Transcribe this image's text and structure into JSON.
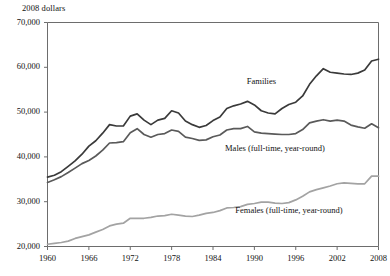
{
  "chart_data": {
    "type": "line",
    "title": "",
    "ylabel": "2008 dollars",
    "xlabel": "",
    "ylim": [
      20000,
      70000
    ],
    "xlim": [
      1960,
      2008
    ],
    "grid": false,
    "legend_position": "inline-annotations",
    "ytick_labels": [
      "70,000",
      "60,000",
      "50,000",
      "40,000",
      "30,000",
      "20,000"
    ],
    "ytick_values": [
      70000,
      60000,
      50000,
      40000,
      30000,
      20000
    ],
    "xtick_labels": [
      "1960",
      "1966",
      "1972",
      "1978",
      "1984",
      "1990",
      "1996",
      "2002",
      "2008"
    ],
    "xtick_values": [
      1960,
      1966,
      1972,
      1978,
      1984,
      1990,
      1996,
      2002,
      2008
    ],
    "x": [
      1960,
      1961,
      1962,
      1963,
      1964,
      1965,
      1966,
      1967,
      1968,
      1969,
      1970,
      1971,
      1972,
      1973,
      1974,
      1975,
      1976,
      1977,
      1978,
      1979,
      1980,
      1981,
      1982,
      1983,
      1984,
      1985,
      1986,
      1987,
      1988,
      1989,
      1990,
      1991,
      1992,
      1993,
      1994,
      1995,
      1996,
      1997,
      1998,
      1999,
      2000,
      2001,
      2002,
      2003,
      2004,
      2005,
      2006,
      2007,
      2008
    ],
    "series": [
      {
        "name": "Families",
        "color": "#3a3a3a",
        "label": "Families",
        "values": [
          35500,
          35900,
          36700,
          37900,
          39100,
          40600,
          42400,
          43600,
          45300,
          47200,
          46900,
          46900,
          49100,
          49600,
          48200,
          47200,
          48200,
          48600,
          50300,
          49800,
          48000,
          47200,
          46600,
          47000,
          48100,
          48900,
          50800,
          51400,
          51800,
          52400,
          51600,
          50300,
          49800,
          49600,
          50800,
          51700,
          52200,
          53600,
          56200,
          58100,
          59700,
          58900,
          58700,
          58500,
          58400,
          58700,
          59400,
          61400,
          61800
        ]
      },
      {
        "name": "Males (full-time, year-round)",
        "color": "#5a5a5a",
        "label": "Males (full-time, year-round)",
        "values": [
          34300,
          34900,
          35600,
          36500,
          37500,
          38500,
          39200,
          40200,
          41500,
          43100,
          43200,
          43400,
          45400,
          46300,
          45000,
          44400,
          45000,
          45200,
          46000,
          45700,
          44400,
          44100,
          43700,
          43800,
          44500,
          44900,
          46000,
          46300,
          46300,
          46800,
          45600,
          45300,
          45200,
          45100,
          45000,
          45000,
          45200,
          46100,
          47600,
          48000,
          48300,
          48000,
          48200,
          48000,
          47100,
          46700,
          46400,
          47400,
          46500
        ]
      },
      {
        "name": "Females (full-time, year-round)",
        "color": "#a3a3a3",
        "label": "Females (full-time, year-round)",
        "values": [
          20500,
          20700,
          20900,
          21200,
          21800,
          22200,
          22600,
          23200,
          23800,
          24600,
          25000,
          25200,
          26300,
          26300,
          26300,
          26500,
          26800,
          26900,
          27200,
          27000,
          26800,
          26700,
          27000,
          27400,
          27600,
          28000,
          28600,
          28700,
          28900,
          29400,
          29600,
          29900,
          29900,
          29700,
          29600,
          29800,
          30400,
          31200,
          32200,
          32700,
          33100,
          33500,
          34000,
          34200,
          34100,
          34000,
          34000,
          35700,
          35700
        ]
      }
    ],
    "annotations": [
      {
        "text": "Families",
        "x": 1991,
        "y": 56800
      },
      {
        "text": "Males (full-time, year-round)",
        "x": 1993,
        "y": 41800
      },
      {
        "text": "Females (full-time, year-round)",
        "x": 1995,
        "y": 28000
      }
    ]
  }
}
